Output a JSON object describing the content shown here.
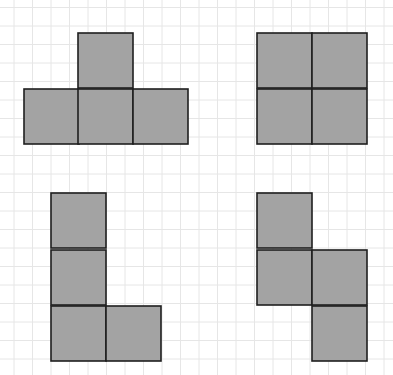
{
  "colors": {
    "background": "#ffffff",
    "grid": "#e6e6e6",
    "fill": "#a3a3a3",
    "stroke": "#1e1e1e"
  },
  "grid": {
    "spacing": 18.5,
    "offset_x": 14,
    "offset_y": 7.5
  },
  "shapes": [
    {
      "name": "t-tetromino",
      "cell_size": 55,
      "cells": [
        {
          "x": 78,
          "y": 33
        },
        {
          "x": 24,
          "y": 89
        },
        {
          "x": 78,
          "y": 89
        },
        {
          "x": 133,
          "y": 89
        }
      ]
    },
    {
      "name": "o-tetromino",
      "cell_size": 55,
      "cells": [
        {
          "x": 257,
          "y": 33
        },
        {
          "x": 312,
          "y": 33
        },
        {
          "x": 257,
          "y": 89
        },
        {
          "x": 312,
          "y": 89
        }
      ]
    },
    {
      "name": "l-tetromino",
      "cell_size": 55,
      "cells": [
        {
          "x": 51,
          "y": 193
        },
        {
          "x": 51,
          "y": 250
        },
        {
          "x": 51,
          "y": 306
        },
        {
          "x": 106,
          "y": 306
        }
      ]
    },
    {
      "name": "s-tetromino",
      "cell_size": 55,
      "cells": [
        {
          "x": 257,
          "y": 193
        },
        {
          "x": 257,
          "y": 250
        },
        {
          "x": 312,
          "y": 250
        },
        {
          "x": 312,
          "y": 306
        }
      ]
    }
  ]
}
